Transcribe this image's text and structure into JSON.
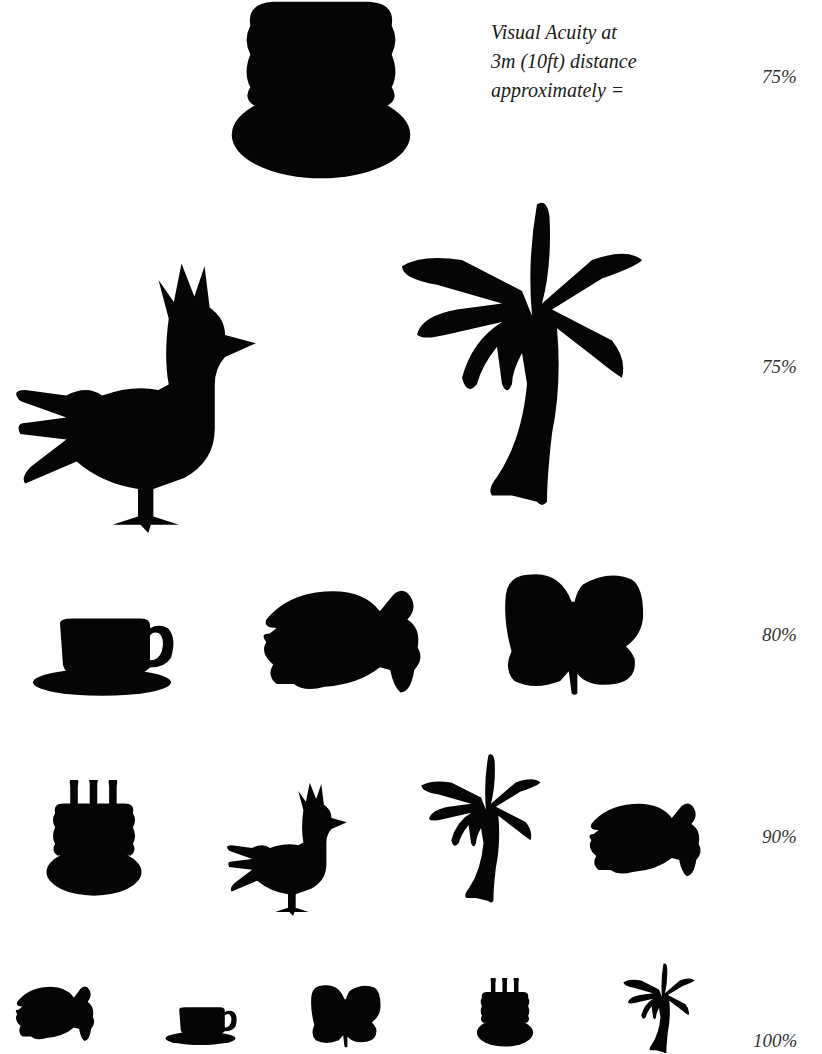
{
  "chart": {
    "caption": {
      "line1": "Visual Acuity at",
      "line2": "3m (10ft) distance",
      "line3": "approximately ="
    },
    "rows": [
      {
        "acuity": "75%",
        "symbols": [
          "cake"
        ]
      },
      {
        "acuity": "75%",
        "symbols": [
          "rooster",
          "palm-tree"
        ]
      },
      {
        "acuity": "80%",
        "symbols": [
          "teacup",
          "fish",
          "butterfly"
        ]
      },
      {
        "acuity": "90%",
        "symbols": [
          "cake",
          "rooster",
          "palm-tree",
          "fish"
        ]
      },
      {
        "acuity": "100%",
        "symbols": [
          "fish",
          "teacup",
          "butterfly",
          "cake",
          "palm-tree"
        ]
      }
    ]
  },
  "colors": {
    "symbol": "#050505",
    "text": "#1a1a1a",
    "background": "#ffffff"
  }
}
